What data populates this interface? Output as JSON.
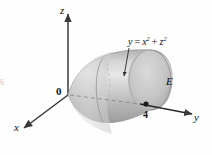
{
  "figure": {
    "background_color": "#fefefe",
    "surface_color": "#c3c3c3",
    "surface_highlight": "#e2e2e2",
    "surface_shadow": "#9a9a9a",
    "axis_color": "#3b3b3b",
    "label_color": "#111111"
  },
  "axes": [
    {
      "name": "z-axis",
      "label": "z",
      "x": 61,
      "y": 6
    },
    {
      "name": "y-axis",
      "label": "y",
      "x": 196,
      "y": 118
    },
    {
      "name": "x-axis",
      "label": "x",
      "x": 16,
      "y": 124
    }
  ],
  "labels": {
    "origin": "0",
    "equation_lhs": "y",
    "equation_eq": "=",
    "equation_term1_base": "x",
    "equation_term1_exp": "2",
    "equation_plus": "+",
    "equation_term2_base": "z",
    "equation_term2_exp": "2",
    "solid": "E",
    "tick_value": "4"
  },
  "annotations": {
    "equation_pointer": "leader line from equation label to paraboloid surface",
    "tick_point": "marked point at y = 4 on the y-axis"
  },
  "margin_artifact": "6"
}
